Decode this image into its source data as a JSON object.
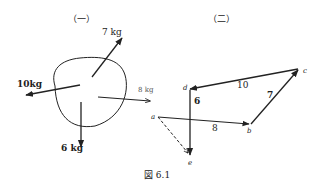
{
  "figure": {
    "caption": "図 6.1",
    "panel1": {
      "title": "（一）",
      "forces": [
        {
          "label": "7 kg",
          "direction": "up-right"
        },
        {
          "label": "10kg",
          "direction": "left"
        },
        {
          "label": "8 kg",
          "direction": "right"
        },
        {
          "label": "6 kg",
          "direction": "down"
        }
      ]
    },
    "panel2": {
      "title": "（二）",
      "points": [
        "a",
        "b",
        "c",
        "d",
        "e"
      ],
      "segments": [
        {
          "from": "a",
          "to": "b",
          "label": "8"
        },
        {
          "from": "b",
          "to": "c",
          "label": "7"
        },
        {
          "from": "c",
          "to": "d",
          "label": "10"
        },
        {
          "from": "d",
          "to": "e",
          "label": "6"
        },
        {
          "from": "a",
          "to": "e",
          "label": "",
          "style": "dashed"
        }
      ]
    }
  }
}
